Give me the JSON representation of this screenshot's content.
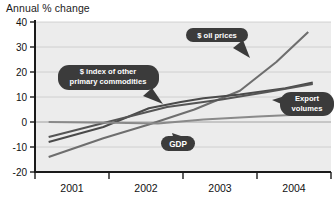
{
  "chart_data": {
    "type": "line",
    "title": "Annual % change",
    "xlabel": "",
    "ylabel": "",
    "ylim": [
      -20,
      40
    ],
    "yticks": [
      40,
      30,
      20,
      10,
      0,
      -10,
      -20
    ],
    "xlim": [
      2000.75,
      2004.0
    ],
    "xticks": [
      "2001",
      "2002",
      "2003",
      "2004"
    ],
    "grid": true,
    "legend": "callout-labels",
    "series": [
      {
        "name": "$ oil prices",
        "color": "#6e6e6e",
        "x": [
          2000.9,
          2001.5,
          2002.0,
          2002.5,
          2003.0,
          2003.4,
          2003.75
        ],
        "values": [
          -14.0,
          -6.5,
          -1.0,
          5.0,
          12.5,
          24.0,
          36.0
        ]
      },
      {
        "name": "$ index of other primary commodities",
        "color": "#4a4a4a",
        "x": [
          2000.9,
          2001.5,
          2002.0,
          2002.35,
          2002.6,
          2003.0,
          2003.5,
          2003.8
        ],
        "values": [
          -8.0,
          -2.0,
          5.5,
          8.0,
          9.5,
          11.0,
          13.5,
          15.8
        ]
      },
      {
        "name": "Export volumes",
        "color": "#555555",
        "x": [
          2000.9,
          2001.6,
          2002.2,
          2002.8,
          2003.3,
          2003.8
        ],
        "values": [
          -6.0,
          0.5,
          6.0,
          9.0,
          12.0,
          15.2
        ]
      },
      {
        "name": "GDP",
        "color": "#8a8a8a",
        "x": [
          2000.9,
          2001.6,
          2002.1,
          2002.6,
          2003.2,
          2003.8
        ],
        "values": [
          0.0,
          -0.3,
          -0.6,
          1.0,
          2.2,
          3.2
        ]
      }
    ],
    "annotations": [
      {
        "name": "oil-prices-callout",
        "text": "$ oil prices",
        "lines": [
          "$ oil prices"
        ]
      },
      {
        "name": "commodities-callout",
        "text": "$ index of other primary commodities",
        "lines": [
          "$ index of other",
          "primary commodities"
        ]
      },
      {
        "name": "export-volumes-callout",
        "text": "Export volumes",
        "lines": [
          "Export",
          "volumes"
        ]
      },
      {
        "name": "gdp-callout",
        "text": "GDP",
        "lines": [
          "GDP"
        ]
      }
    ],
    "colors": {
      "plot_background": "#ececec",
      "grid": "#c8c8c8",
      "axis": "#1a1a1a",
      "callout_fill": "#3b3b3b",
      "callout_text": "#ffffff"
    }
  }
}
